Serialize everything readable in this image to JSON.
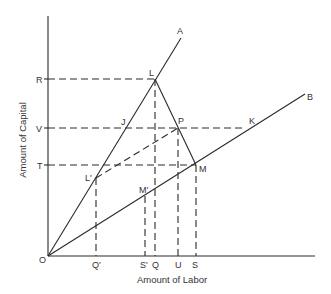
{
  "diagram": {
    "axes": {
      "x_label": "Amount of Labor",
      "y_label": "Amount of Capital",
      "origin_label": "O"
    },
    "rays": [
      {
        "name": "A",
        "label": "A"
      },
      {
        "name": "B",
        "label": "B"
      }
    ],
    "y_ticks": [
      {
        "label": "R"
      },
      {
        "label": "V"
      },
      {
        "label": "T"
      }
    ],
    "x_ticks": [
      {
        "label": "Q'"
      },
      {
        "label": "S'"
      },
      {
        "label": "Q"
      },
      {
        "label": "U"
      },
      {
        "label": "S"
      }
    ],
    "points": [
      {
        "label": "L"
      },
      {
        "label": "J"
      },
      {
        "label": "P"
      },
      {
        "label": "K"
      },
      {
        "label": "L'"
      },
      {
        "label": "M'"
      },
      {
        "label": "M"
      }
    ],
    "colors": {
      "line": "#2a2a2a",
      "text": "#333333",
      "background": "#ffffff"
    }
  }
}
